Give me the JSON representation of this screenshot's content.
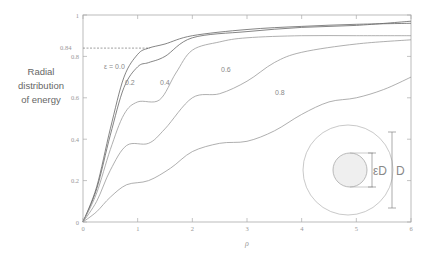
{
  "chart_data": {
    "type": "line",
    "title": "",
    "xlabel": "ρ",
    "ylabel": "Radial distribution of energy",
    "ylabel_lines": [
      "Radial",
      "distribution",
      "of energy"
    ],
    "xlim": [
      0,
      6
    ],
    "ylim": [
      0,
      1
    ],
    "x_ticks": [
      "0",
      "1",
      "2",
      "3",
      "4",
      "5",
      "6"
    ],
    "y_ticks": [
      "0",
      "0.2",
      "0.4",
      "0.6",
      "0.8",
      "1"
    ],
    "grid": false,
    "legend": "inline curve labels",
    "annotations": [
      {
        "text": "0.84",
        "type": "dashed horizontal reference line",
        "y": 0.84,
        "x_range": [
          0,
          1.2
        ]
      }
    ],
    "series": [
      {
        "name": "ε = 0.0",
        "label": "ε = 0.0",
        "x": [
          0,
          0.25,
          0.5,
          0.75,
          1.0,
          1.2,
          1.5,
          2.0,
          3.0,
          4.0,
          5.0,
          6.0
        ],
        "y": [
          0,
          0.17,
          0.45,
          0.7,
          0.81,
          0.84,
          0.86,
          0.9,
          0.93,
          0.945,
          0.955,
          0.96
        ]
      },
      {
        "name": "ε = 0.2",
        "label": "0.2",
        "x": [
          0,
          0.25,
          0.5,
          0.75,
          1.0,
          1.2,
          1.5,
          2.0,
          3.0,
          4.0,
          5.0,
          6.0
        ],
        "y": [
          0,
          0.16,
          0.42,
          0.65,
          0.75,
          0.77,
          0.8,
          0.89,
          0.92,
          0.94,
          0.95,
          0.97
        ]
      },
      {
        "name": "ε = 0.4",
        "label": "0.4",
        "x": [
          0,
          0.25,
          0.5,
          0.75,
          1.0,
          1.4,
          1.7,
          2.0,
          2.5,
          3.0,
          4.0,
          5.0,
          6.0
        ],
        "y": [
          0,
          0.14,
          0.35,
          0.52,
          0.58,
          0.59,
          0.72,
          0.83,
          0.87,
          0.89,
          0.9,
          0.9,
          0.9
        ]
      },
      {
        "name": "ε = 0.6",
        "label": "0.6",
        "x": [
          0,
          0.25,
          0.5,
          0.8,
          1.2,
          1.5,
          2.0,
          2.5,
          3.0,
          3.5,
          4.0,
          5.0,
          6.0
        ],
        "y": [
          0,
          0.1,
          0.25,
          0.37,
          0.38,
          0.45,
          0.6,
          0.62,
          0.68,
          0.77,
          0.82,
          0.86,
          0.88
        ]
      },
      {
        "name": "ε = 0.8",
        "label": "0.8",
        "x": [
          0,
          0.25,
          0.5,
          0.8,
          1.2,
          1.6,
          2.0,
          2.5,
          3.0,
          3.5,
          4.0,
          4.5,
          5.0,
          5.5,
          6.0
        ],
        "y": [
          0,
          0.05,
          0.12,
          0.18,
          0.2,
          0.26,
          0.34,
          0.38,
          0.39,
          0.44,
          0.52,
          0.58,
          0.6,
          0.64,
          0.7
        ]
      }
    ],
    "inset": {
      "description": "Annular aperture diagram: outer circle diameter D, inner obscured disk diameter εD",
      "labels": [
        "εD",
        "D"
      ]
    }
  }
}
